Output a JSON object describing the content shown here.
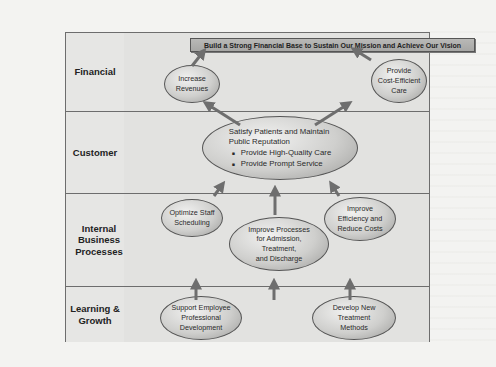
{
  "perspectives": [
    {
      "label": "Financial"
    },
    {
      "label": "Customer"
    },
    {
      "label": "Internal Business Processes"
    },
    {
      "label": "Learning & Growth"
    }
  ],
  "financial": {
    "goal": "Build a Strong Financial Base to Sustain Our Mission and Achieve Our Vision",
    "objectives": [
      {
        "line1": "Increase",
        "line2": "Revenues"
      },
      {
        "line1": "Provide",
        "line2": "Cost-Efficient",
        "line3": "Care"
      }
    ]
  },
  "customer": {
    "title_line1": "Satisfy Patients and Maintain",
    "title_line2": "Public Reputation",
    "bullets": [
      "Provide High-Quality Care",
      "Provide Prompt Service"
    ]
  },
  "internal": {
    "objectives": [
      {
        "line1": "Optimize Staff",
        "line2": "Scheduling"
      },
      {
        "line1": "Improve Processes",
        "line2": "for Admission,",
        "line3": "Treatment,",
        "line4": "and Discharge"
      },
      {
        "line1": "Improve",
        "line2": "Efficiency and",
        "line3": "Reduce Costs"
      }
    ]
  },
  "learning": {
    "objectives": [
      {
        "line1": "Support Employee",
        "line2": "Professional",
        "line3": "Development"
      },
      {
        "line1": "Develop New",
        "line2": "Treatment",
        "line3": "Methods"
      }
    ]
  },
  "colors": {
    "border": "#6d6d6d",
    "cell_bg": "#e2e2e0",
    "arrow": "#707070",
    "goal_bg": "#b0b0ae"
  }
}
